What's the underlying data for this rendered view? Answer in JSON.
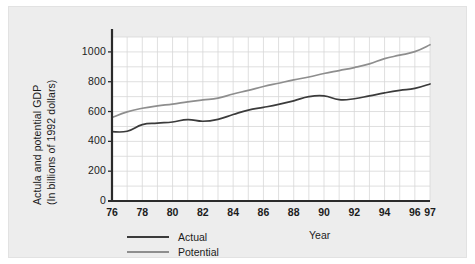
{
  "chart_data": {
    "type": "line",
    "title": "",
    "xlabel": "Year",
    "ylabel_line1": "Actula and potential GDP",
    "ylabel_line2": "(In billions of 1992 dollars)",
    "xlim": [
      76,
      97
    ],
    "ylim": [
      0,
      1100
    ],
    "ytick_labels": [
      "0",
      "200",
      "400",
      "600",
      "800",
      "1000"
    ],
    "ytick_values": [
      0,
      200,
      400,
      600,
      800,
      1000
    ],
    "xtick_labels": [
      "76",
      "78",
      "80",
      "82",
      "84",
      "86",
      "88",
      "90",
      "92",
      "94",
      "96",
      "97"
    ],
    "xtick_values": [
      76,
      78,
      80,
      82,
      84,
      86,
      88,
      90,
      92,
      94,
      96,
      97
    ],
    "grid": true,
    "grid_color": "#d7d7d7",
    "legend_position": "below-left",
    "x": [
      76,
      77,
      78,
      79,
      80,
      81,
      82,
      83,
      84,
      85,
      86,
      87,
      88,
      89,
      90,
      91,
      92,
      93,
      94,
      95,
      96,
      97
    ],
    "series": [
      {
        "name": "Actual",
        "color": "#3b3b3b",
        "values": [
          465,
          468,
          512,
          522,
          530,
          546,
          535,
          548,
          580,
          610,
          628,
          648,
          672,
          700,
          705,
          680,
          686,
          705,
          725,
          742,
          755,
          785
        ]
      },
      {
        "name": "Potential",
        "color": "#8e8e8e",
        "values": [
          560,
          598,
          622,
          638,
          650,
          665,
          678,
          690,
          718,
          742,
          768,
          790,
          812,
          832,
          855,
          875,
          895,
          920,
          955,
          978,
          1002,
          1048
        ]
      }
    ]
  },
  "legend": {
    "items": [
      {
        "label": "Actual",
        "color": "#3b3b3b"
      },
      {
        "label": "Potential",
        "color": "#8e8e8e"
      }
    ]
  },
  "axes": {
    "x_axis_title": "Year"
  }
}
